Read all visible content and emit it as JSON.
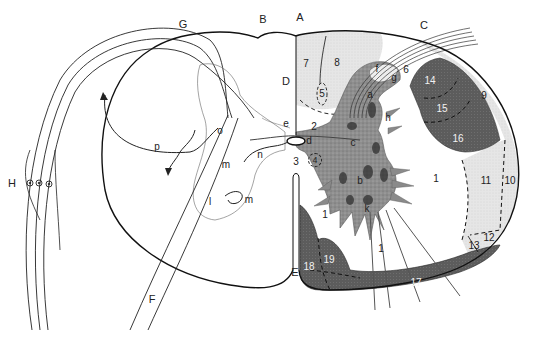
{
  "diagram": {
    "colors": {
      "outline": "#1a1a1a",
      "white_matter_light": "#e4e4e4",
      "tract_dark": "#5a5a5a",
      "gray_matter": "#8c8c8c",
      "background": "#ffffff"
    },
    "capital_labels": [
      {
        "id": "A",
        "text": "A",
        "x": 300,
        "y": 17
      },
      {
        "id": "B",
        "text": "B",
        "x": 263,
        "y": 19
      },
      {
        "id": "C",
        "text": "C",
        "x": 424,
        "y": 25
      },
      {
        "id": "D",
        "text": "D",
        "x": 286,
        "y": 81
      },
      {
        "id": "E",
        "text": "E",
        "x": 295,
        "y": 272
      },
      {
        "id": "F",
        "text": "F",
        "x": 152,
        "y": 299
      },
      {
        "id": "G",
        "text": "G",
        "x": 183,
        "y": 24
      },
      {
        "id": "H",
        "text": "H",
        "x": 12,
        "y": 183
      }
    ],
    "lowercase_labels": [
      {
        "id": "a",
        "text": "a",
        "x": 370,
        "y": 95
      },
      {
        "id": "b",
        "text": "b",
        "x": 360,
        "y": 181
      },
      {
        "id": "c",
        "text": "c",
        "x": 353,
        "y": 143
      },
      {
        "id": "d",
        "text": "d",
        "x": 309,
        "y": 141
      },
      {
        "id": "e",
        "text": "e",
        "x": 286,
        "y": 124
      },
      {
        "id": "f",
        "text": "f",
        "x": 377,
        "y": 69
      },
      {
        "id": "g",
        "text": "g",
        "x": 394,
        "y": 78
      },
      {
        "id": "h",
        "text": "h",
        "x": 388,
        "y": 118
      },
      {
        "id": "k",
        "text": "k",
        "x": 367,
        "y": 209
      },
      {
        "id": "l",
        "text": "l",
        "x": 210,
        "y": 202
      },
      {
        "id": "m1",
        "text": "m",
        "x": 226,
        "y": 165
      },
      {
        "id": "m2",
        "text": "m",
        "x": 249,
        "y": 200
      },
      {
        "id": "n",
        "text": "n",
        "x": 260,
        "y": 155
      },
      {
        "id": "o",
        "text": "o",
        "x": 220,
        "y": 131
      },
      {
        "id": "p",
        "text": "p",
        "x": 157,
        "y": 147
      }
    ],
    "numbered_regions": [
      {
        "id": "1a",
        "text": "1",
        "x": 436,
        "y": 179,
        "tone": "dark"
      },
      {
        "id": "1b",
        "text": "1",
        "x": 325,
        "y": 215,
        "tone": "dark"
      },
      {
        "id": "1c",
        "text": "1",
        "x": 381,
        "y": 249,
        "tone": "dark"
      },
      {
        "id": "2",
        "text": "2",
        "x": 314,
        "y": 127,
        "tone": "dark"
      },
      {
        "id": "3",
        "text": "3",
        "x": 296,
        "y": 162,
        "tone": "dark"
      },
      {
        "id": "4",
        "text": "4",
        "x": 315,
        "y": 160,
        "tone": "circled"
      },
      {
        "id": "5",
        "text": "5",
        "x": 322,
        "y": 94,
        "tone": "dark"
      },
      {
        "id": "6",
        "text": "6",
        "x": 406,
        "y": 70,
        "tone": "dark"
      },
      {
        "id": "7",
        "text": "7",
        "x": 306,
        "y": 64,
        "tone": "dark"
      },
      {
        "id": "8",
        "text": "8",
        "x": 337,
        "y": 63,
        "tone": "dark"
      },
      {
        "id": "9",
        "text": "9",
        "x": 484,
        "y": 96,
        "tone": "dark"
      },
      {
        "id": "10",
        "text": "10",
        "x": 510,
        "y": 181,
        "tone": "dark"
      },
      {
        "id": "11",
        "text": "11",
        "x": 486,
        "y": 181,
        "tone": "dark"
      },
      {
        "id": "12",
        "text": "12",
        "x": 489,
        "y": 238,
        "tone": "dark"
      },
      {
        "id": "13",
        "text": "13",
        "x": 474,
        "y": 246,
        "tone": "dark"
      },
      {
        "id": "14",
        "text": "14",
        "x": 430,
        "y": 81,
        "tone": "light"
      },
      {
        "id": "15",
        "text": "15",
        "x": 442,
        "y": 109,
        "tone": "light"
      },
      {
        "id": "16",
        "text": "16",
        "x": 458,
        "y": 139,
        "tone": "light"
      },
      {
        "id": "17",
        "text": "17",
        "x": 416,
        "y": 283,
        "tone": "light"
      },
      {
        "id": "18",
        "text": "18",
        "x": 309,
        "y": 267,
        "tone": "light"
      },
      {
        "id": "19",
        "text": "19",
        "x": 329,
        "y": 260,
        "tone": "light"
      }
    ]
  }
}
